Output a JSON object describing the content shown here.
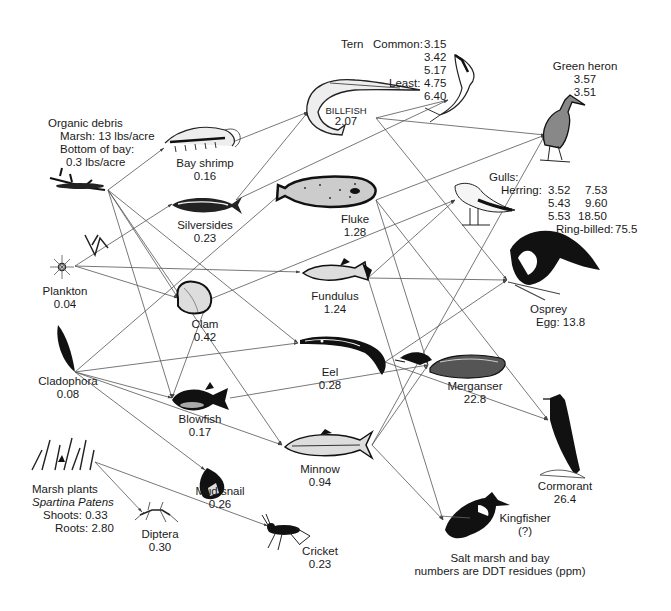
{
  "caption": {
    "line1": "Salt marsh and bay",
    "line2": "numbers are DDT residues (ppm)"
  },
  "nodes": {
    "organic_debris": {
      "name": "Organic debris",
      "marsh": "Marsh: 13 lbs/acre",
      "bay": "Bottom of bay:",
      "bay_value": "0.3 lbs/acre",
      "icon": "debris-icon"
    },
    "plankton": {
      "name": "Plankton",
      "value": "0.04",
      "icon": "plankton-icon"
    },
    "cladophora": {
      "name": "Cladophora",
      "value": "0.08",
      "icon": "algae-icon"
    },
    "marsh_plants": {
      "name": "Marsh plants",
      "species": "Spartina Patens",
      "shoots": "Shoots: 0.33",
      "roots": "Roots: 2.80",
      "icon": "grass-icon"
    },
    "bay_shrimp": {
      "name": "Bay shrimp",
      "value": "0.16",
      "icon": "shrimp-icon"
    },
    "silversides": {
      "name": "Silversides",
      "value": "0.23",
      "icon": "fish-icon"
    },
    "clam": {
      "name": "Clam",
      "value": "0.42",
      "icon": "clam-icon"
    },
    "blowfish": {
      "name": "Blowfish",
      "value": "0.17",
      "icon": "blowfish-icon"
    },
    "mud_snail": {
      "name": "Mud snail",
      "value": "0.26",
      "icon": "snail-icon"
    },
    "diptera": {
      "name": "Diptera",
      "value": "0.30",
      "icon": "fly-icon"
    },
    "cricket": {
      "name": "Cricket",
      "value": "0.23",
      "icon": "cricket-icon"
    },
    "billfish": {
      "name": "BILLFISH",
      "value": "2.07",
      "icon": "billfish-icon"
    },
    "fluke": {
      "name": "Fluke",
      "value": "1.28",
      "icon": "flounder-icon"
    },
    "fundulus": {
      "name": "Fundulus",
      "value": "1.24",
      "icon": "fish-icon"
    },
    "eel": {
      "name": "Eel",
      "value": "0.28",
      "icon": "eel-icon"
    },
    "minnow": {
      "name": "Minnow",
      "value": "0.94",
      "icon": "fish-icon"
    },
    "tern": {
      "name": "Tern",
      "common_label": "Common:",
      "common_values": [
        "3.15",
        "3.42",
        "5.17"
      ],
      "least_label": "Least:",
      "least_values": [
        "4.75",
        "6.40"
      ],
      "icon": "tern-icon"
    },
    "green_heron": {
      "name": "Green heron",
      "values": [
        "3.57",
        "3.51"
      ],
      "icon": "heron-icon"
    },
    "gulls": {
      "name": "Gulls:",
      "herring_label": "Herring:",
      "herring_values": [
        "3.52",
        "7.53",
        "5.43",
        "9.60",
        "5.53",
        "18.50"
      ],
      "ring_billed_label": "Ring-billed:",
      "ring_billed_value": "75.5",
      "icon": "gull-icon"
    },
    "osprey": {
      "name": "Osprey",
      "value": "Egg: 13.8",
      "icon": "osprey-icon"
    },
    "merganser": {
      "name": "Merganser",
      "value": "22.8",
      "icon": "duck-icon"
    },
    "cormorant": {
      "name": "Cormorant",
      "value": "26.4",
      "icon": "cormorant-icon"
    },
    "kingfisher": {
      "name": "Kingfisher",
      "value": "(?)",
      "icon": "kingfisher-icon"
    }
  },
  "edges": [
    [
      "organic_debris",
      "bay_shrimp"
    ],
    [
      "organic_debris",
      "clam"
    ],
    [
      "organic_debris",
      "blowfish"
    ],
    [
      "organic_debris",
      "eel"
    ],
    [
      "organic_debris",
      "minnow"
    ],
    [
      "plankton",
      "silversides"
    ],
    [
      "plankton",
      "clam"
    ],
    [
      "plankton",
      "fundulus"
    ],
    [
      "cladophora",
      "fluke"
    ],
    [
      "cladophora",
      "eel"
    ],
    [
      "cladophora",
      "blowfish"
    ],
    [
      "cladophora",
      "mud_snail"
    ],
    [
      "cladophora",
      "minnow"
    ],
    [
      "marsh_plants",
      "diptera"
    ],
    [
      "marsh_plants",
      "cricket"
    ],
    [
      "bay_shrimp",
      "billfish"
    ],
    [
      "silversides",
      "billfish"
    ],
    [
      "silversides",
      "tern"
    ],
    [
      "clam",
      "blowfish"
    ],
    [
      "clam",
      "gulls"
    ],
    [
      "billfish",
      "green_heron"
    ],
    [
      "billfish",
      "tern"
    ],
    [
      "billfish",
      "osprey"
    ],
    [
      "fluke",
      "merganser"
    ],
    [
      "fluke",
      "cormorant"
    ],
    [
      "fluke",
      "green_heron"
    ],
    [
      "fundulus",
      "gulls"
    ],
    [
      "fundulus",
      "osprey"
    ],
    [
      "fundulus",
      "kingfisher"
    ],
    [
      "eel",
      "osprey"
    ],
    [
      "eel",
      "cormorant"
    ],
    [
      "blowfish",
      "merganser"
    ],
    [
      "minnow",
      "merganser"
    ],
    [
      "minnow",
      "kingfisher"
    ],
    [
      "minnow",
      "green_heron"
    ]
  ]
}
